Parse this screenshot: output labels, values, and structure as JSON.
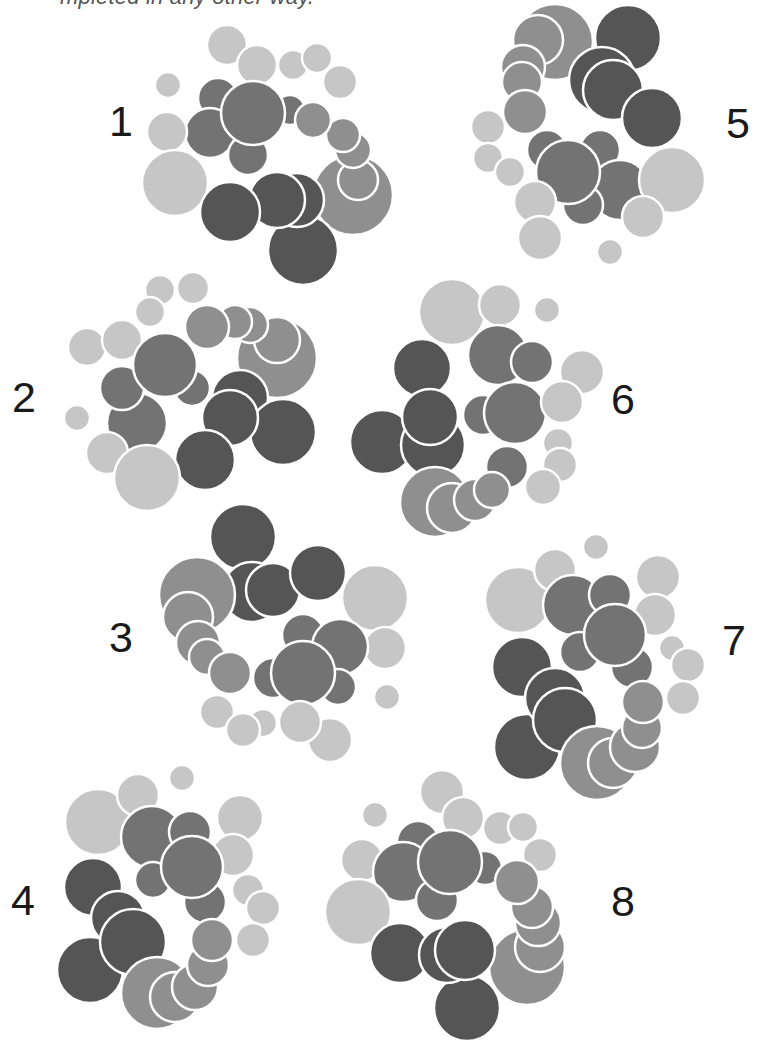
{
  "caption_fragment": "mpleted in any other way.",
  "palette": {
    "light": "#c6c6c6",
    "medium": "#8f8f8f",
    "medium_dark": "#737373",
    "dark": "#555555",
    "stroke": "#ffffff",
    "label": "#1a1a1a"
  },
  "figures": [
    {
      "label": "1",
      "label_pos": [
        121,
        121
      ],
      "circles": [
        [
          "light",
          227,
          45,
          20
        ],
        [
          "light",
          293,
          65,
          15
        ],
        [
          "light",
          317,
          58,
          15
        ],
        [
          "light",
          340,
          82,
          17
        ],
        [
          "light",
          257,
          65,
          20
        ],
        [
          "light",
          168,
          85,
          13
        ],
        [
          "medium_dark",
          218,
          98,
          20
        ],
        [
          "medium_dark",
          290,
          110,
          15
        ],
        [
          "medium_dark",
          210,
          133,
          25
        ],
        [
          "medium_dark",
          248,
          155,
          20
        ],
        [
          "medium_dark",
          253,
          113,
          32
        ],
        [
          "light",
          167,
          132,
          20
        ],
        [
          "light",
          175,
          183,
          33
        ],
        [
          "medium",
          353,
          195,
          40
        ],
        [
          "medium",
          358,
          180,
          20
        ],
        [
          "medium",
          353,
          150,
          18
        ],
        [
          "medium",
          343,
          135,
          17
        ],
        [
          "medium",
          313,
          120,
          18
        ],
        [
          "dark",
          303,
          250,
          35
        ],
        [
          "dark",
          297,
          200,
          27
        ],
        [
          "dark",
          277,
          200,
          28
        ],
        [
          "dark",
          230,
          212,
          30
        ]
      ]
    },
    {
      "label": "2",
      "label_pos": [
        24,
        397
      ],
      "circles": [
        [
          "light",
          160,
          290,
          15
        ],
        [
          "light",
          193,
          288,
          16
        ],
        [
          "light",
          150,
          312,
          15
        ],
        [
          "light",
          87,
          347,
          19
        ],
        [
          "light",
          122,
          340,
          20
        ],
        [
          "medium",
          277,
          358,
          40
        ],
        [
          "medium",
          277,
          340,
          23
        ],
        [
          "medium",
          250,
          325,
          18
        ],
        [
          "medium",
          235,
          322,
          17
        ],
        [
          "medium",
          207,
          327,
          22
        ],
        [
          "medium_dark",
          137,
          423,
          30
        ],
        [
          "medium_dark",
          192,
          388,
          18
        ],
        [
          "medium_dark",
          122,
          388,
          22
        ],
        [
          "medium_dark",
          165,
          365,
          32
        ],
        [
          "light",
          77,
          418,
          13
        ],
        [
          "dark",
          240,
          398,
          28
        ],
        [
          "dark",
          283,
          432,
          33
        ],
        [
          "dark",
          230,
          418,
          28
        ],
        [
          "dark",
          205,
          460,
          30
        ],
        [
          "light",
          107,
          453,
          21
        ],
        [
          "light",
          147,
          478,
          33
        ]
      ]
    },
    {
      "label": "3",
      "label_pos": [
        121,
        637
      ],
      "circles": [
        [
          "dark",
          243,
          537,
          33
        ],
        [
          "dark",
          252,
          592,
          30
        ],
        [
          "dark",
          273,
          590,
          27
        ],
        [
          "dark",
          318,
          573,
          28
        ],
        [
          "medium",
          197,
          595,
          38
        ],
        [
          "medium",
          188,
          617,
          25
        ],
        [
          "medium",
          198,
          643,
          22
        ],
        [
          "medium",
          207,
          657,
          18
        ],
        [
          "medium",
          230,
          673,
          21
        ],
        [
          "light",
          375,
          598,
          33
        ],
        [
          "light",
          385,
          648,
          21
        ],
        [
          "light",
          387,
          697,
          13
        ],
        [
          "medium_dark",
          303,
          635,
          21
        ],
        [
          "medium_dark",
          340,
          647,
          28
        ],
        [
          "medium_dark",
          273,
          678,
          20
        ],
        [
          "medium_dark",
          338,
          687,
          18
        ],
        [
          "medium_dark",
          303,
          673,
          32
        ],
        [
          "light",
          217,
          712,
          17
        ],
        [
          "light",
          263,
          723,
          14
        ],
        [
          "light",
          243,
          730,
          17
        ],
        [
          "light",
          330,
          740,
          22
        ],
        [
          "light",
          300,
          722,
          21
        ]
      ]
    },
    {
      "label": "4",
      "label_pos": [
        23,
        900
      ],
      "circles": [
        [
          "light",
          98,
          822,
          33
        ],
        [
          "light",
          138,
          795,
          21
        ],
        [
          "light",
          182,
          778,
          13
        ],
        [
          "light",
          240,
          818,
          23
        ],
        [
          "light",
          233,
          855,
          21
        ],
        [
          "light",
          248,
          890,
          16
        ],
        [
          "light",
          263,
          908,
          17
        ],
        [
          "light",
          253,
          940,
          17
        ],
        [
          "medium_dark",
          152,
          837,
          31
        ],
        [
          "medium_dark",
          190,
          832,
          21
        ],
        [
          "medium_dark",
          153,
          880,
          18
        ],
        [
          "medium_dark",
          205,
          902,
          21
        ],
        [
          "medium_dark",
          192,
          867,
          31
        ],
        [
          "dark",
          93,
          887,
          29
        ],
        [
          "dark",
          90,
          970,
          33
        ],
        [
          "dark",
          118,
          918,
          27
        ],
        [
          "dark",
          133,
          942,
          33
        ],
        [
          "medium",
          157,
          993,
          36
        ],
        [
          "medium",
          175,
          997,
          25
        ],
        [
          "medium",
          195,
          987,
          23
        ],
        [
          "medium",
          208,
          965,
          21
        ],
        [
          "medium",
          212,
          940,
          21
        ]
      ]
    },
    {
      "label": "5",
      "label_pos": [
        738,
        123
      ],
      "circles": [
        [
          "medium",
          555,
          42,
          38
        ],
        [
          "medium",
          538,
          40,
          25
        ],
        [
          "medium",
          523,
          67,
          22
        ],
        [
          "medium",
          522,
          82,
          20
        ],
        [
          "medium",
          525,
          112,
          22
        ],
        [
          "dark",
          628,
          38,
          33
        ],
        [
          "dark",
          602,
          80,
          33
        ],
        [
          "dark",
          613,
          90,
          30
        ],
        [
          "dark",
          652,
          118,
          30
        ],
        [
          "light",
          488,
          127,
          17
        ],
        [
          "light",
          488,
          158,
          15
        ],
        [
          "light",
          510,
          172,
          15
        ],
        [
          "medium_dark",
          547,
          150,
          20
        ],
        [
          "medium_dark",
          600,
          150,
          20
        ],
        [
          "medium_dark",
          620,
          190,
          30
        ],
        [
          "medium_dark",
          583,
          205,
          20
        ],
        [
          "medium_dark",
          568,
          172,
          32
        ],
        [
          "light",
          535,
          202,
          21
        ],
        [
          "light",
          540,
          238,
          22
        ],
        [
          "light",
          672,
          180,
          33
        ],
        [
          "light",
          643,
          217,
          21
        ],
        [
          "light",
          610,
          252,
          13
        ]
      ]
    },
    {
      "label": "6",
      "label_pos": [
        623,
        399
      ],
      "circles": [
        [
          "light",
          452,
          312,
          33
        ],
        [
          "light",
          500,
          305,
          21
        ],
        [
          "light",
          547,
          310,
          13
        ],
        [
          "medium_dark",
          498,
          355,
          30
        ],
        [
          "medium_dark",
          532,
          362,
          21
        ],
        [
          "light",
          582,
          372,
          22
        ],
        [
          "dark",
          422,
          368,
          29
        ],
        [
          "dark",
          382,
          442,
          32
        ],
        [
          "dark",
          433,
          445,
          32
        ],
        [
          "dark",
          430,
          417,
          28
        ],
        [
          "medium_dark",
          483,
          415,
          20
        ],
        [
          "medium_dark",
          515,
          413,
          31
        ],
        [
          "light",
          562,
          402,
          21
        ],
        [
          "light",
          558,
          443,
          15
        ],
        [
          "light",
          560,
          465,
          17
        ],
        [
          "light",
          543,
          487,
          18
        ],
        [
          "medium_dark",
          507,
          467,
          21
        ],
        [
          "medium",
          435,
          502,
          35
        ],
        [
          "medium",
          452,
          508,
          25
        ],
        [
          "medium",
          475,
          500,
          21
        ],
        [
          "medium",
          492,
          490,
          18
        ]
      ]
    },
    {
      "label": "7",
      "label_pos": [
        734,
        640
      ],
      "circles": [
        [
          "light",
          518,
          600,
          33
        ],
        [
          "light",
          555,
          570,
          21
        ],
        [
          "light",
          596,
          547,
          13
        ],
        [
          "light",
          658,
          577,
          22
        ],
        [
          "light",
          655,
          615,
          21
        ],
        [
          "medium_dark",
          573,
          605,
          30
        ],
        [
          "medium_dark",
          610,
          595,
          21
        ],
        [
          "medium_dark",
          580,
          652,
          20
        ],
        [
          "medium_dark",
          632,
          667,
          21
        ],
        [
          "medium_dark",
          615,
          635,
          31
        ],
        [
          "light",
          672,
          648,
          13
        ],
        [
          "light",
          688,
          665,
          17
        ],
        [
          "light",
          683,
          698,
          17
        ],
        [
          "dark",
          522,
          667,
          30
        ],
        [
          "dark",
          527,
          747,
          33
        ],
        [
          "dark",
          555,
          698,
          30
        ],
        [
          "dark",
          565,
          720,
          32
        ],
        [
          "medium",
          597,
          763,
          37
        ],
        [
          "medium",
          613,
          763,
          25
        ],
        [
          "medium",
          635,
          747,
          25
        ],
        [
          "medium",
          642,
          728,
          20
        ],
        [
          "medium",
          643,
          702,
          21
        ]
      ]
    },
    {
      "label": "8",
      "label_pos": [
        623,
        901
      ],
      "circles": [
        [
          "light",
          442,
          792,
          22
        ],
        [
          "light",
          463,
          818,
          21
        ],
        [
          "light",
          500,
          828,
          17
        ],
        [
          "light",
          523,
          827,
          15
        ],
        [
          "light",
          540,
          855,
          17
        ],
        [
          "light",
          375,
          815,
          13
        ],
        [
          "light",
          362,
          860,
          21
        ],
        [
          "medium_dark",
          418,
          842,
          21
        ],
        [
          "medium_dark",
          403,
          872,
          30
        ],
        [
          "medium_dark",
          437,
          900,
          21
        ],
        [
          "medium_dark",
          485,
          868,
          17
        ],
        [
          "medium_dark",
          450,
          862,
          32
        ],
        [
          "light",
          358,
          912,
          33
        ],
        [
          "medium",
          527,
          967,
          38
        ],
        [
          "medium",
          540,
          947,
          25
        ],
        [
          "medium",
          538,
          923,
          23
        ],
        [
          "medium",
          532,
          907,
          21
        ],
        [
          "medium",
          517,
          882,
          22
        ],
        [
          "dark",
          467,
          1008,
          33
        ],
        [
          "dark",
          400,
          953,
          30
        ],
        [
          "dark",
          447,
          955,
          28
        ],
        [
          "dark",
          465,
          950,
          30
        ]
      ]
    }
  ]
}
